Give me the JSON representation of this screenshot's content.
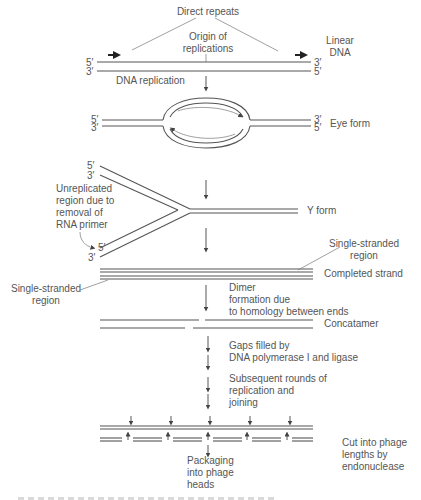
{
  "figure": {
    "title_top": "Direct repeats",
    "origin_label": [
      "Origin of",
      "replications"
    ],
    "stages": [
      {
        "id": "linear",
        "label": [
          "Linear",
          "DNA"
        ],
        "left_ends": [
          "5′",
          "3′"
        ],
        "right_ends": [
          "3′",
          "5′"
        ]
      },
      {
        "id": "eye",
        "label": "Eye form",
        "left_ends": [
          "5′",
          "3′"
        ],
        "right_ends": [
          "3′",
          "5′"
        ]
      },
      {
        "id": "y",
        "label": "Y form",
        "top_ends": [
          "5′",
          "3′"
        ],
        "bottom_ends": [
          "5′",
          "3′"
        ]
      },
      {
        "id": "completed",
        "label": "Completed strand"
      },
      {
        "id": "concatamer",
        "label": "Concatamer"
      },
      {
        "id": "cut",
        "label": [
          "Cut into phage",
          "lengths by",
          "endonuclease"
        ]
      }
    ],
    "step_labels": {
      "dna_replication": "DNA replication",
      "unreplicated": [
        "Unreplicated",
        "region due to",
        "removal of",
        "RNA primer"
      ],
      "single_stranded_right": [
        "Single-stranded",
        "region"
      ],
      "single_stranded_left": [
        "Single-stranded",
        "region"
      ],
      "dimer": [
        "Dimer",
        "formation due",
        "to homology between ends"
      ],
      "gaps": [
        "Gaps filled by",
        "DNA polymerase I and ligase"
      ],
      "rounds": [
        "Subsequent rounds of",
        "replication and",
        "joining"
      ],
      "packaging": [
        "Packaging",
        "into phage",
        "heads"
      ]
    }
  }
}
